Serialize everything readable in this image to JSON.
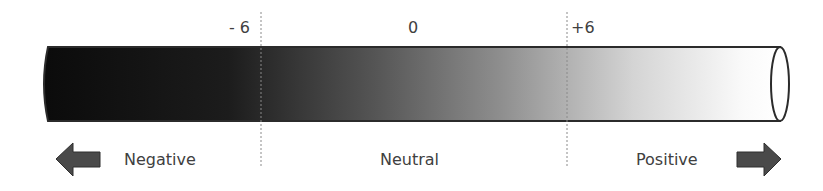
{
  "scale": {
    "ticks": [
      {
        "label": "- 6",
        "x": 261
      },
      {
        "label": "0",
        "x": 413
      },
      {
        "label": "+6",
        "x": 567
      }
    ]
  },
  "categories": {
    "negative": "Negative",
    "neutral": "Neutral",
    "positive": "Positive"
  },
  "colors": {
    "gradient_start": "#0d0d0d",
    "gradient_mid": "#6e6e6e",
    "gradient_end": "#ffffff",
    "outline": "#2b2b2b",
    "arrow_fill": "#4a4a4a",
    "text": "#404040",
    "divider": "#8a8a8a"
  },
  "icons": {
    "left": "arrow-left-icon",
    "right": "arrow-right-icon"
  }
}
